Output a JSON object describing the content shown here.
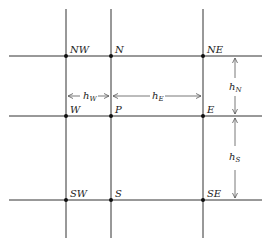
{
  "diagram": {
    "colors": {
      "line": "#333333",
      "node": "#111111",
      "text": "#222222",
      "arrow": "#555555"
    },
    "nodes": {
      "NW": "NW",
      "N": "N",
      "NE": "NE",
      "W": "W",
      "P": "P",
      "E": "E",
      "SW": "SW",
      "S": "S",
      "SE": "SE"
    },
    "spacings": {
      "hW": {
        "base": "h",
        "sub": "W"
      },
      "hE": {
        "base": "h",
        "sub": "E"
      },
      "hN": {
        "base": "h",
        "sub": "N"
      },
      "hS": {
        "base": "h",
        "sub": "S"
      }
    }
  }
}
